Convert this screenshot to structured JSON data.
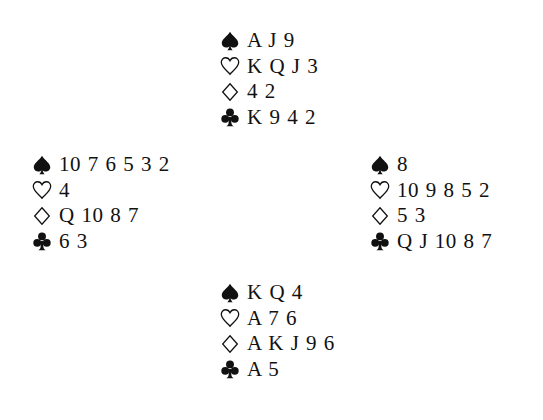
{
  "diagram": {
    "type": "bridge-deal",
    "suit_icons": {
      "spades": "spade-icon",
      "hearts": "heart-outline-icon",
      "diamonds": "diamond-outline-icon",
      "clubs": "club-icon"
    },
    "hands": {
      "north": {
        "spades": "A J 9",
        "hearts": "K Q J 3",
        "diamonds": "4 2",
        "clubs": "K 9 4 2"
      },
      "west": {
        "spades": "10 7 6 5 3 2",
        "hearts": "4",
        "diamonds": "Q 10 8 7",
        "clubs": "6 3"
      },
      "east": {
        "spades": "8",
        "hearts": "10 9 8 5 2",
        "diamonds": "5 3",
        "clubs": "Q J 10 8 7"
      },
      "south": {
        "spades": "K Q 4",
        "hearts": "A 7 6",
        "diamonds": "A K J 9 6",
        "clubs": "A 5"
      }
    },
    "colors": {
      "text": "#111111",
      "background": "#ffffff"
    }
  }
}
